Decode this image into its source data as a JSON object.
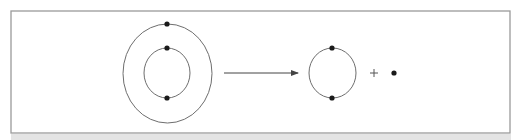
{
  "diagram": {
    "type": "atom-ionization-schematic",
    "colors": {
      "frame": "#9a9a9a",
      "orbit": "#6e6e6e",
      "electron": "#1a1a1a",
      "arrow": "#444444",
      "plus": "#555555",
      "background": "#ffffff"
    },
    "frame": {
      "x": 11,
      "y": 11,
      "width": 499,
      "height": 122
    },
    "reactant_atom": {
      "label": "atom with two electron shells",
      "shells": [
        {
          "name": "outer-shell",
          "cx": 167.5,
          "cy": 73.5,
          "rx": 44.5,
          "ry": 49.5,
          "electrons": [
            {
              "x": 167,
              "y": 24
            }
          ]
        },
        {
          "name": "inner-shell",
          "cx": 167,
          "cy": 73,
          "rx": 23,
          "ry": 25,
          "electrons": [
            {
              "x": 167,
              "y": 48
            },
            {
              "x": 167,
              "y": 98
            }
          ]
        }
      ]
    },
    "arrow": {
      "x1": 224,
      "y1": 73,
      "x2": 298,
      "y2": 73
    },
    "product_ion": {
      "label": "ion with one electron shell",
      "shells": [
        {
          "name": "remaining-shell",
          "cx": 332.5,
          "cy": 73,
          "rx": 23.5,
          "ry": 25,
          "electrons": [
            {
              "x": 332,
              "y": 48
            },
            {
              "x": 332,
              "y": 98
            }
          ]
        }
      ]
    },
    "plus_sign": {
      "symbol": "+",
      "cx": 374,
      "cy": 73,
      "arm": 4
    },
    "free_electron": {
      "label": "released electron",
      "x": 394,
      "y": 73,
      "r": 2.6
    }
  }
}
